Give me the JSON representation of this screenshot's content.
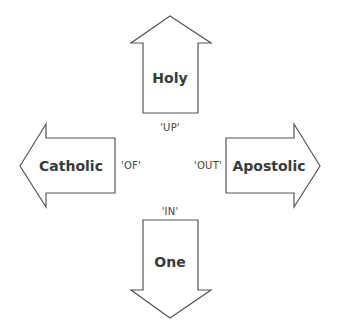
{
  "diagram": {
    "arrows": [
      {
        "id": "up",
        "label": "Holy",
        "direction_label": "'UP'"
      },
      {
        "id": "left",
        "label": "Catholic",
        "direction_label": "'OF'"
      },
      {
        "id": "right",
        "label": "Apostolic",
        "direction_label": "'OUT'"
      },
      {
        "id": "down",
        "label": "One",
        "direction_label": "'IN'"
      }
    ],
    "colors": {
      "stroke": "#555555",
      "fill": "#ffffff",
      "text": "#3a3a3a"
    }
  }
}
